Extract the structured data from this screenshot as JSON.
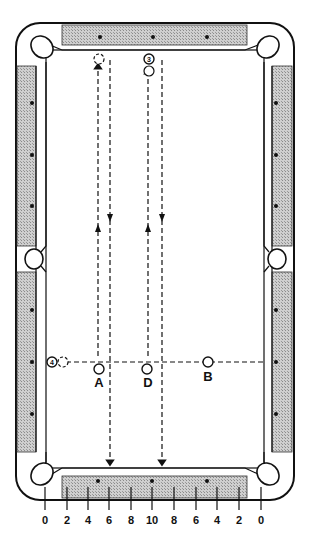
{
  "diagram": {
    "balls": [
      {
        "id": "3",
        "label": "3"
      },
      {
        "id": "4",
        "label": "4"
      }
    ],
    "points": [
      {
        "id": "A",
        "label": "A"
      },
      {
        "id": "D",
        "label": "D"
      },
      {
        "id": "B",
        "label": "B"
      }
    ],
    "scale_labels": [
      "0",
      "2",
      "4",
      "6",
      "8",
      "10",
      "8",
      "6",
      "4",
      "2",
      "0"
    ],
    "colors": {
      "rail_shade": "#bdbdbd",
      "line": "#111111"
    }
  }
}
